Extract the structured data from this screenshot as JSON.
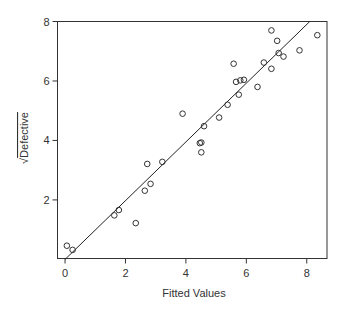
{
  "chart_data": {
    "type": "scatter",
    "title": "",
    "xlabel": "Fitted Values",
    "ylabel": "√Defective",
    "ylabel_parts": {
      "radical": "√",
      "text": "Defective"
    },
    "xlim": [
      -0.25,
      8.67
    ],
    "ylim": [
      0.03,
      8.0
    ],
    "xticks": [
      0,
      2,
      4,
      6,
      8
    ],
    "yticks": [
      2,
      4,
      6,
      8
    ],
    "grid": false,
    "legend": null,
    "marker": "open-circle",
    "colors": {
      "points": "#333333",
      "line": "#222222",
      "frame": "#333333"
    },
    "points": [
      {
        "x": 0.06,
        "y": 0.46
      },
      {
        "x": 0.25,
        "y": 0.32
      },
      {
        "x": 1.63,
        "y": 1.48
      },
      {
        "x": 1.78,
        "y": 1.66
      },
      {
        "x": 2.34,
        "y": 1.22
      },
      {
        "x": 2.64,
        "y": 2.31
      },
      {
        "x": 2.83,
        "y": 2.54
      },
      {
        "x": 2.72,
        "y": 3.21
      },
      {
        "x": 3.22,
        "y": 3.28
      },
      {
        "x": 3.89,
        "y": 4.9
      },
      {
        "x": 4.46,
        "y": 3.91
      },
      {
        "x": 4.51,
        "y": 3.93
      },
      {
        "x": 4.51,
        "y": 3.6
      },
      {
        "x": 4.6,
        "y": 4.48
      },
      {
        "x": 5.1,
        "y": 4.77
      },
      {
        "x": 5.38,
        "y": 5.2
      },
      {
        "x": 5.75,
        "y": 5.54
      },
      {
        "x": 5.66,
        "y": 5.97
      },
      {
        "x": 5.8,
        "y": 6.02
      },
      {
        "x": 5.92,
        "y": 6.04
      },
      {
        "x": 5.58,
        "y": 6.58
      },
      {
        "x": 6.37,
        "y": 5.8
      },
      {
        "x": 6.58,
        "y": 6.62
      },
      {
        "x": 6.83,
        "y": 6.41
      },
      {
        "x": 6.83,
        "y": 7.7
      },
      {
        "x": 7.02,
        "y": 7.35
      },
      {
        "x": 7.07,
        "y": 6.94
      },
      {
        "x": 7.23,
        "y": 6.82
      },
      {
        "x": 7.76,
        "y": 7.03
      },
      {
        "x": 8.35,
        "y": 7.54
      }
    ],
    "fit_line": {
      "x0": 0.0,
      "y0": 0.0,
      "x1": 8.1,
      "y1": 8.0
    }
  }
}
